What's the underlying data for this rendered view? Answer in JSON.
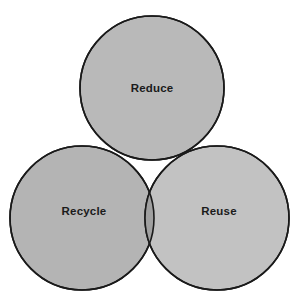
{
  "diagram": {
    "type": "venn",
    "set_count": 3,
    "background_color": "#ffffff",
    "outline_color": "#1a1a1a",
    "outline_width": 1.6,
    "canvas": {
      "width": 305,
      "height": 302
    },
    "sets": [
      {
        "id": "reduce",
        "label": "Reduce",
        "fill_color": "#b9b9b9",
        "label_color": "#1b1b1b",
        "center": {
          "x": 152,
          "y": 88
        },
        "radius": 72,
        "label_position": {
          "x": 152,
          "y": 89
        }
      },
      {
        "id": "recycle",
        "label": "Recycle",
        "fill_color": "#b4b4b4",
        "label_color": "#1b1b1b",
        "center": {
          "x": 82,
          "y": 218
        },
        "radius": 72,
        "label_position": {
          "x": 84,
          "y": 212
        }
      },
      {
        "id": "reuse",
        "label": "Reuse",
        "fill_color": "#c2c2c2",
        "label_color": "#1b1b1b",
        "center": {
          "x": 217,
          "y": 218
        },
        "radius": 72,
        "label_position": {
          "x": 219,
          "y": 212
        }
      }
    ],
    "overlaps": [
      {
        "id": "reduce-recycle",
        "sets": [
          "reduce",
          "recycle"
        ],
        "fill_color": "#8f8f8f"
      },
      {
        "id": "reduce-reuse",
        "sets": [
          "reduce",
          "reuse"
        ],
        "fill_color": "#a8a8a8"
      },
      {
        "id": "recycle-reuse",
        "sets": [
          "recycle",
          "reuse"
        ],
        "fill_color": "#a0a0a0"
      },
      {
        "id": "reduce-recycle-reuse",
        "sets": [
          "reduce",
          "recycle",
          "reuse"
        ],
        "fill_color": "#8a8a8a"
      }
    ]
  }
}
